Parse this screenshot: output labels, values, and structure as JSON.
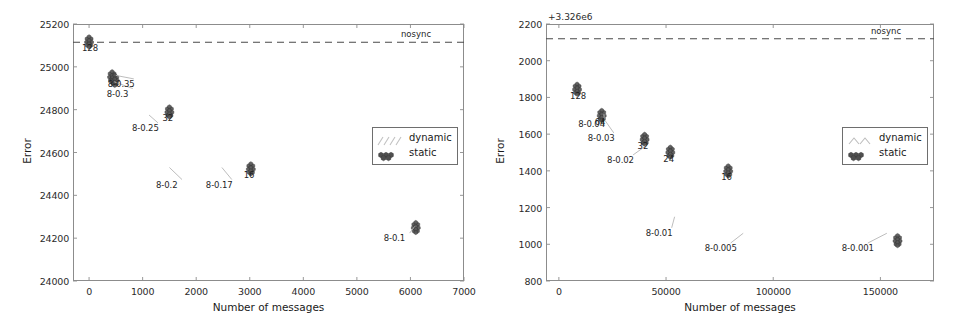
{
  "figure": {
    "panels": [
      "left",
      "right"
    ]
  },
  "chart_data": [
    {
      "id": "left",
      "type": "scatter",
      "title": "",
      "xlabel": "Number of messages",
      "ylabel": "Error",
      "xlim": [
        -300,
        7000
      ],
      "ylim": [
        24000,
        25200
      ],
      "xticks": [
        "0",
        "1000",
        "2000",
        "3000",
        "4000",
        "5000",
        "6000",
        "7000"
      ],
      "xtick_values": [
        0,
        1000,
        2000,
        3000,
        4000,
        5000,
        6000,
        7000
      ],
      "yticks": [
        "24000",
        "24200",
        "24400",
        "24600",
        "24800",
        "25000",
        "25200"
      ],
      "ytick_values": [
        24000,
        24200,
        24400,
        24600,
        24800,
        25000,
        25200
      ],
      "y_offset_text": "",
      "grid": false,
      "legend_position": "right-center",
      "legend": [
        {
          "name": "dynamic",
          "marker": "diagonal-hatch",
          "color": "#b9b9b9"
        },
        {
          "name": "static",
          "marker": "hexagon-cluster",
          "color": "#4a4a4a"
        }
      ],
      "reference_line": {
        "label": "nosync",
        "y": 25115,
        "style": "dashed",
        "color": "#4a4a4a"
      },
      "static_points": [
        {
          "label": "128",
          "x": 0,
          "y": 25115
        },
        {
          "label": "",
          "x": 430,
          "y": 24952
        },
        {
          "label": "",
          "x": 480,
          "y": 24935
        },
        {
          "label": "32",
          "x": 1500,
          "y": 24788
        },
        {
          "label": "16",
          "x": 3020,
          "y": 24522
        },
        {
          "label": "",
          "x": 6100,
          "y": 24248
        }
      ],
      "dynamic_annotations": [
        {
          "label": "8-0.35",
          "tip_x": 500,
          "tip_y": 24960,
          "text_x": 350,
          "text_y": 24925
        },
        {
          "label": "8-0.3",
          "tip_x": 470,
          "tip_y": 24930,
          "text_x": 330,
          "text_y": 24880
        },
        {
          "label": "8-0.25",
          "tip_x": 1120,
          "tip_y": 24775,
          "text_x": 800,
          "text_y": 24720
        },
        {
          "label": "8-0.2",
          "tip_x": 1500,
          "tip_y": 24530,
          "text_x": 1250,
          "text_y": 24455
        },
        {
          "label": "8-0.17",
          "tip_x": 2480,
          "tip_y": 24530,
          "text_x": 2180,
          "text_y": 24455
        },
        {
          "label": "8-0.1",
          "tip_x": 6080,
          "tip_y": 24255,
          "text_x": 5500,
          "text_y": 24205
        }
      ]
    },
    {
      "id": "right",
      "type": "scatter",
      "title": "",
      "xlabel": "Number of messages",
      "ylabel": "Error",
      "xlim": [
        -6000,
        175000
      ],
      "ylim": [
        800,
        2200
      ],
      "xticks": [
        "0",
        "50000",
        "100000",
        "150000"
      ],
      "xtick_values": [
        0,
        50000,
        100000,
        150000
      ],
      "yticks": [
        "800",
        "1000",
        "1200",
        "1400",
        "1600",
        "1800",
        "2000",
        "2200"
      ],
      "ytick_values": [
        800,
        1000,
        1200,
        1400,
        1600,
        1800,
        2000,
        2200
      ],
      "y_offset_text": "+3.326e6",
      "grid": false,
      "legend_position": "right-center",
      "legend": [
        {
          "name": "dynamic",
          "marker": "diagonal-hatch",
          "color": "#b9b9b9"
        },
        {
          "name": "static",
          "marker": "hexagon-cluster",
          "color": "#4a4a4a"
        }
      ],
      "reference_line": {
        "label": "nosync",
        "y": 2120,
        "style": "dashed",
        "color": "#4a4a4a"
      },
      "static_points": [
        {
          "label": "128",
          "x": 8500,
          "y": 1843
        },
        {
          "label": "64",
          "x": 20000,
          "y": 1700
        },
        {
          "label": "32",
          "x": 40000,
          "y": 1570
        },
        {
          "label": "24",
          "x": 52000,
          "y": 1500
        },
        {
          "label": "16",
          "x": 79000,
          "y": 1398
        },
        {
          "label": "",
          "x": 158000,
          "y": 1018
        }
      ],
      "dynamic_annotations": [
        {
          "label": "8-0.04",
          "tip_x": 21000,
          "tip_y": 1712,
          "text_x": 9000,
          "text_y": 1660
        },
        {
          "label": "8-0.03",
          "tip_x": 21500,
          "tip_y": 1675,
          "text_x": 13500,
          "text_y": 1585
        },
        {
          "label": "8-0.02",
          "tip_x": 41000,
          "tip_y": 1540,
          "text_x": 22500,
          "text_y": 1465
        },
        {
          "label": "8-0.01",
          "tip_x": 54000,
          "tip_y": 1150,
          "text_x": 40500,
          "text_y": 1068
        },
        {
          "label": "8-0.005",
          "tip_x": 86000,
          "tip_y": 1060,
          "text_x": 68000,
          "text_y": 985
        },
        {
          "label": "8-0.001",
          "tip_x": 153000,
          "tip_y": 1060,
          "text_x": 132000,
          "text_y": 985
        }
      ]
    }
  ]
}
